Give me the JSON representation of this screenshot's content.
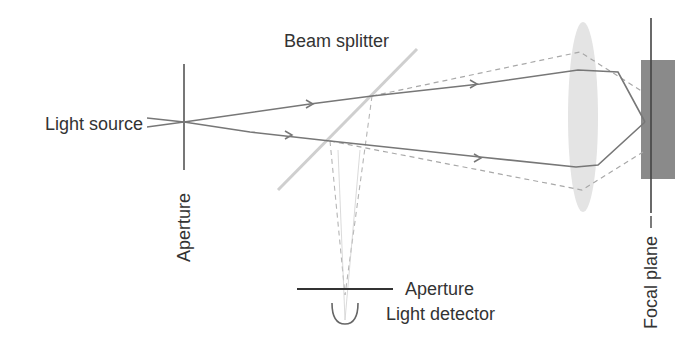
{
  "diagram": {
    "labels": {
      "light_source": "Light source",
      "beam_splitter": "Beam splitter",
      "aperture_source": "Aperture",
      "aperture_detector": "Aperture",
      "light_detector": "Light detector",
      "focal_plane": "Focal plane"
    },
    "colors": {
      "beam": "#777777",
      "dashed_beam": "#a8a8a8",
      "splitter": "#cfcfcf",
      "lens": "#e2e2e2",
      "specimen": "#8a8a8a",
      "line": "#444444",
      "text": "#333333"
    }
  }
}
